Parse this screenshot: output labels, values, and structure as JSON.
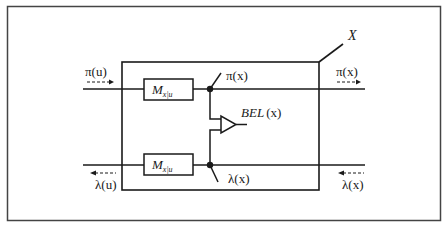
{
  "diagram": {
    "node_label": "X",
    "inputs": {
      "pi_u": "π(u)",
      "lambda_u": "λ(u)"
    },
    "outputs": {
      "pi_x_inner": "π(x)",
      "pi_x_outer": "π(x)",
      "lambda_x_inner": "λ(x)",
      "lambda_x_outer": "λ(x)"
    },
    "matrix_top": {
      "main": "M",
      "sub": "x|u"
    },
    "matrix_bottom": {
      "main": "M",
      "sub": "x|u"
    },
    "belief": {
      "main": "BEL",
      "arg": "(x)"
    },
    "colors": {
      "ink": "#1a1a1a",
      "background": "#ffffff",
      "frame": "#444444"
    }
  }
}
